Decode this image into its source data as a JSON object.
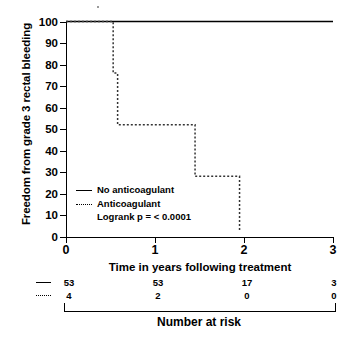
{
  "chart_data": {
    "type": "line",
    "title": "",
    "xlabel": "Time in years following treatment",
    "ylabel": "Freedom from grade 3 rectal bleeding",
    "xlim": [
      0,
      3
    ],
    "ylim": [
      0,
      100
    ],
    "xticks": [
      0,
      1,
      2,
      3
    ],
    "xtick_labels": [
      "0",
      "1",
      "2",
      "3"
    ],
    "yticks": [
      0,
      10,
      20,
      30,
      40,
      50,
      60,
      70,
      80,
      90,
      100
    ],
    "ytick_labels": [
      "0",
      "10",
      "20",
      "30",
      "40",
      "50",
      "60",
      "70",
      "80",
      "90",
      "100"
    ],
    "grid": false,
    "legend_position": "lower-left-inside",
    "annotation": "Logrank p = < 0.0001",
    "series": [
      {
        "name": "No anticoagulant",
        "style": "solid",
        "color": "#000000",
        "steps_x": [
          0,
          3
        ],
        "steps_y": [
          100,
          100
        ]
      },
      {
        "name": "Anticoagulant",
        "style": "dashed",
        "color": "#333333",
        "steps_x": [
          0,
          0.53,
          0.53,
          0.58,
          0.58,
          1.45,
          1.45,
          1.95,
          1.95
        ],
        "steps_y": [
          100,
          100,
          76,
          76,
          52,
          52,
          28,
          28,
          3
        ]
      }
    ]
  },
  "axes": {
    "y_title": "Freedom from grade 3 rectal bleeding",
    "x_title": "Time in years following treatment"
  },
  "legend": {
    "entries": [
      {
        "label": "No anticoagulant",
        "style": "solid"
      },
      {
        "label": "Anticoagulant",
        "style": "dashed"
      }
    ],
    "statistic": "Logrank p = < 0.0001"
  },
  "risk_table": {
    "title": "Number at risk",
    "time_points": [
      0,
      1,
      2,
      3
    ],
    "rows": [
      {
        "style": "solid",
        "series": "No anticoagulant",
        "counts": [
          "53",
          "53",
          "17",
          "3"
        ]
      },
      {
        "style": "dashed",
        "series": "Anticoagulant",
        "counts": [
          "4",
          "2",
          "0",
          "0"
        ]
      }
    ]
  }
}
